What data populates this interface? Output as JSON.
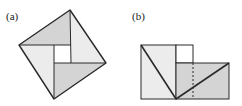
{
  "figures": {
    "a": {
      "label": "(a)"
    },
    "b": {
      "label": "(b)"
    }
  },
  "colors": {
    "light_fill": "#ececec",
    "dark_fill": "#d4d4d4",
    "stroke": "#2a2a2a",
    "background": "#ffffff"
  }
}
